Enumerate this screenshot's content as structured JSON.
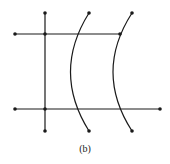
{
  "caption": "(b)",
  "colors": {
    "stroke": "#1a1a1a",
    "background": "#ffffff"
  },
  "lines": [
    {
      "id": "vertical",
      "x1": 45,
      "y1": 13,
      "x2": 45,
      "y2": 131
    },
    {
      "id": "top-horizontal",
      "x1": 15,
      "y1": 34,
      "x2": 120,
      "y2": 34
    },
    {
      "id": "bottom-horizontal",
      "x1": 15,
      "y1": 109,
      "x2": 160,
      "y2": 109
    }
  ],
  "arcs": [
    {
      "id": "arc-left",
      "start": [
        89,
        13
      ],
      "control": [
        52,
        72
      ],
      "end": [
        89,
        131
      ]
    },
    {
      "id": "arc-right",
      "start": [
        132,
        13
      ],
      "control": [
        94,
        72
      ],
      "end": [
        132,
        131
      ]
    }
  ],
  "nodes": [
    [
      45,
      13
    ],
    [
      15,
      34
    ],
    [
      45,
      34
    ],
    [
      120,
      34
    ],
    [
      89,
      13
    ],
    [
      132,
      13
    ],
    [
      15,
      109
    ],
    [
      45,
      109
    ],
    [
      160,
      109
    ],
    [
      45,
      131
    ],
    [
      89,
      131
    ],
    [
      132,
      131
    ]
  ]
}
